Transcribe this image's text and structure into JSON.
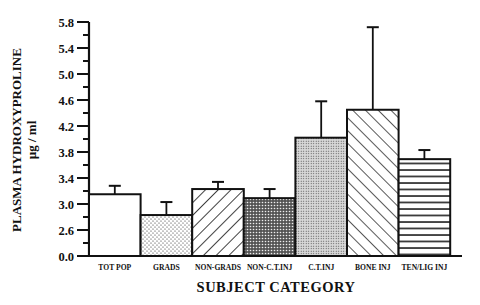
{
  "chart_data": {
    "type": "bar",
    "title": "",
    "xlabel": "SUBJECT CATEGORY",
    "ylabel": "PLASMA HYDROXYPROLINE",
    "ylabel_units": "µg / ml",
    "categories": [
      "TOT POP",
      "GRADS",
      "NON-GRADS",
      "NON-C.T.INJ",
      "C.T.INJ",
      "BONE INJ",
      "TEN/LIG INJ"
    ],
    "values": [
      3.15,
      2.83,
      3.23,
      3.09,
      4.02,
      4.45,
      3.69
    ],
    "error_upper": [
      3.28,
      3.03,
      3.34,
      3.23,
      4.58,
      5.72,
      3.83
    ],
    "patterns": [
      "white",
      "dots",
      "diagonal-forward",
      "crosshatch-dense",
      "fine-dots",
      "diagonal-backward",
      "horizontal-lines"
    ],
    "y_ticks": [
      "0.0",
      "2.6",
      "3.0",
      "3.4",
      "3.8",
      "4.2",
      "4.6",
      "5.0",
      "5.4",
      "5.8"
    ],
    "y_axis_break": "axis jumps from 0.0 to 2.6 (broken scale)",
    "ylim": [
      2.6,
      5.8
    ],
    "grid": false,
    "legend": null
  }
}
